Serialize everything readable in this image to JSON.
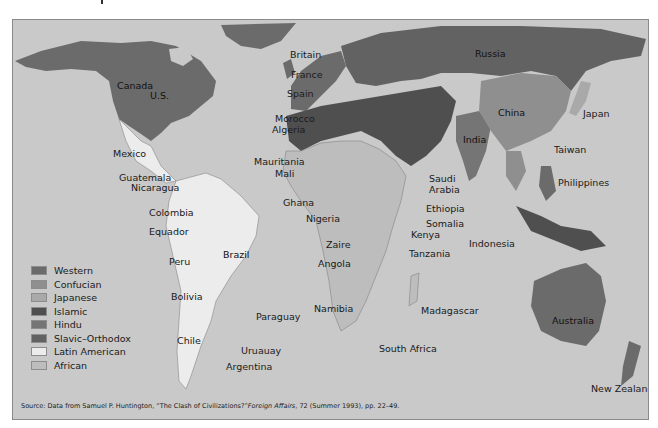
{
  "map": {
    "title": "World civilizations map",
    "background_color": "#c9c9c9",
    "labels": {
      "canada": "Canada",
      "us": "U.S.",
      "mexico": "Mexico",
      "guatemala": "Guatemala",
      "nicaragua": "Nicaragua",
      "colombia": "Colombia",
      "equador": "Equador",
      "peru": "Peru",
      "brazil": "Brazil",
      "bolivia": "Bolivia",
      "paraguay": "Paraguay",
      "chile": "Chile",
      "uruauay": "Uruauay",
      "argentina": "Argentina",
      "britain": "Britain",
      "france": "France",
      "spain": "Spain",
      "morocco": "Morocco",
      "algeria": "Algeria",
      "mauritania": "Mauritania",
      "mali": "Mali",
      "ghana": "Ghana",
      "nigeria": "Nigeria",
      "zaire": "Zaire",
      "angola": "Angola",
      "namibia": "Namibia",
      "south_africa": "South Africa",
      "madagascar": "Madagascar",
      "saudi_arabia_1": "Saudi",
      "saudi_arabia_2": "Arabia",
      "ethiopia": "Ethiopia",
      "somalia": "Somalia",
      "kenya": "Kenya",
      "tanzania": "Tanzania",
      "russia": "Russia",
      "china": "China",
      "japan": "Japan",
      "india": "India",
      "taiwan": "Taiwan",
      "philippines": "Philippines",
      "indonesia": "Indonesia",
      "australia": "Australia",
      "new_zealand": "New Zealand"
    }
  },
  "legend": {
    "items": [
      {
        "label": "Western",
        "color": "#6b6b6b"
      },
      {
        "label": "Confucian",
        "color": "#8f8f8f"
      },
      {
        "label": "Japanese",
        "color": "#a9a9a9"
      },
      {
        "label": "Islamic",
        "color": "#4f4f4f"
      },
      {
        "label": "Hindu",
        "color": "#757575"
      },
      {
        "label": "Slavic–Orthodox",
        "color": "#626262"
      },
      {
        "label": "Latin American",
        "color": "#ececec"
      },
      {
        "label": "African",
        "color": "#bdbdbd"
      }
    ]
  },
  "source": {
    "prefix": "Source: Data from Samuel P. Huntington, “The Clash of Civilizations?”",
    "journal": "Foreign Affairs",
    "suffix": ", 72 (Summer 1993), pp. 22–49."
  }
}
